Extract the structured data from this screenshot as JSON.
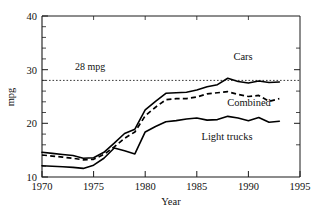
{
  "chart_data": {
    "type": "line",
    "title": "",
    "xlabel": "Year",
    "ylabel": "mpg",
    "xlim": [
      1970,
      1995
    ],
    "ylim": [
      10,
      40
    ],
    "xticks": [
      1970,
      1975,
      1980,
      1985,
      1990,
      1995
    ],
    "yticks": [
      10,
      20,
      30,
      40
    ],
    "x_minor_step": 1,
    "y_minor_step": 2,
    "grid": false,
    "legend": "inline-labels",
    "x": [
      1970,
      1971,
      1972,
      1973,
      1974,
      1975,
      1976,
      1977,
      1978,
      1979,
      1980,
      1981,
      1982,
      1983,
      1984,
      1985,
      1986,
      1987,
      1988,
      1989,
      1990,
      1991,
      1992,
      1993
    ],
    "series": [
      {
        "name": "Cars",
        "style": "solid",
        "label": "Cars",
        "values": [
          14.6,
          14.4,
          14.2,
          14.0,
          13.5,
          13.6,
          14.6,
          16.3,
          18.1,
          18.9,
          22.5,
          24.1,
          25.6,
          25.7,
          25.8,
          26.2,
          26.8,
          27.2,
          28.4,
          27.8,
          27.5,
          27.9,
          27.6,
          27.7
        ]
      },
      {
        "name": "Combined",
        "style": "dashed",
        "label": "Combined",
        "values": [
          14.1,
          13.9,
          13.7,
          13.5,
          13.2,
          13.3,
          14.2,
          15.6,
          17.2,
          18.4,
          21.4,
          23.0,
          24.4,
          24.6,
          24.6,
          24.9,
          25.5,
          25.7,
          25.9,
          25.4,
          25.0,
          25.2,
          24.1,
          24.6
        ]
      },
      {
        "name": "Light trucks",
        "style": "solid",
        "label": "Light trucks",
        "values": [
          12.1,
          12.0,
          11.9,
          11.8,
          11.6,
          12.2,
          13.5,
          15.4,
          14.9,
          14.3,
          18.4,
          19.4,
          20.3,
          20.5,
          20.8,
          21.0,
          20.6,
          20.7,
          21.3,
          21.0,
          20.5,
          21.1,
          20.2,
          20.4
        ]
      }
    ],
    "annotations": [
      {
        "name": "reference-line-28mpg",
        "type": "hline",
        "value": 28,
        "label": "28 mpg",
        "style": "dotted"
      }
    ]
  },
  "axes": {
    "y_tick_labels": [
      "40",
      "30",
      "20",
      "10"
    ],
    "x_tick_labels": [
      "1970",
      "1975",
      "1980",
      "1985",
      "1990",
      "1995"
    ],
    "y_title": "mpg",
    "x_title": "Year"
  },
  "labels": {
    "cars": "Cars",
    "combined": "Combined",
    "light_trucks": "Light trucks",
    "reference": "28 mpg"
  }
}
